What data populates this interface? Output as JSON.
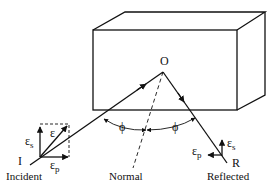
{
  "figure": {
    "labels": {
      "origin_point": "O",
      "incident_point": "I",
      "reflected_point": "R",
      "incident_caption": "Incident",
      "reflected_caption": "Reflected",
      "normal_caption": "Normal",
      "angle_incident": "ϕ",
      "angle_reflected": "ϕ",
      "field_vector": "ε",
      "s_component_incident": "ε",
      "s_subscript_incident": "s",
      "p_component_incident": "ε",
      "p_subscript_incident": "p",
      "s_component_reflected": "ε",
      "s_subscript_reflected": "s",
      "p_component_reflected": "ε",
      "p_subscript_reflected": "p"
    },
    "colors": {
      "stroke": "#111111",
      "background": "#ffffff"
    }
  }
}
